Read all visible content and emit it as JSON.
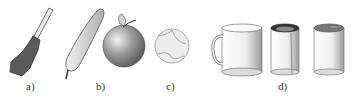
{
  "figure": {
    "labels": [
      "a)",
      "b)",
      "c)",
      "d)"
    ],
    "objects": {
      "a": "screwdriver",
      "b": [
        "sausage-shape",
        "apple"
      ],
      "c": "tennis-ball",
      "d": [
        "mug",
        "cylinder-with-cut",
        "closed-cylinder"
      ]
    }
  }
}
